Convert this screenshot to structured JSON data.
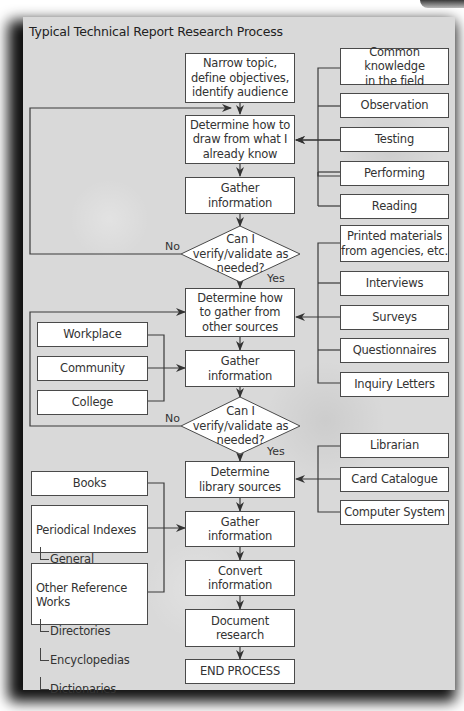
{
  "title": "Typical Technical Report Research Process",
  "main_flow": {
    "narrow_topic": "Narrow topic,\ndefine objectives,\nidentify audience",
    "determine_known": "Determine how to\ndraw from what I\nalready know",
    "gather_1": "Gather\ninformation",
    "decision_1": "Can I\nverify/validate as\nneeded?",
    "determine_other": "Determine how\nto gather from\nother sources",
    "gather_2": "Gather\ninformation",
    "decision_2": "Can I\nverify/validate as\nneeded?",
    "determine_library": "Determine\nlibrary sources",
    "gather_3": "Gather\ninformation",
    "convert": "Convert\ninformation",
    "document": "Document\nresearch",
    "end": "END PROCESS"
  },
  "decision_labels": {
    "no_1": "No",
    "yes_1": "Yes",
    "no_2": "No",
    "yes_2": "Yes"
  },
  "known_sources": [
    "Common knowledge\nin the field",
    "Observation",
    "Testing",
    "Performing",
    "Reading"
  ],
  "other_sources": [
    "Printed materials\nfrom agencies, etc.",
    "Interviews",
    "Surveys",
    "Questionnaires",
    "Inquiry Letters"
  ],
  "community_sources": [
    "Workplace",
    "Community",
    "College"
  ],
  "library_helpers": [
    "Librarian",
    "Card Catalogue",
    "Computer System"
  ],
  "library_materials": {
    "books": "Books",
    "periodical": {
      "head": "Periodical Indexes",
      "items": [
        "General",
        "Specialized"
      ]
    },
    "reference": {
      "head": "Other Reference Works",
      "items": [
        "Directories",
        "Encyclopedias",
        "Dictionaries"
      ]
    }
  }
}
